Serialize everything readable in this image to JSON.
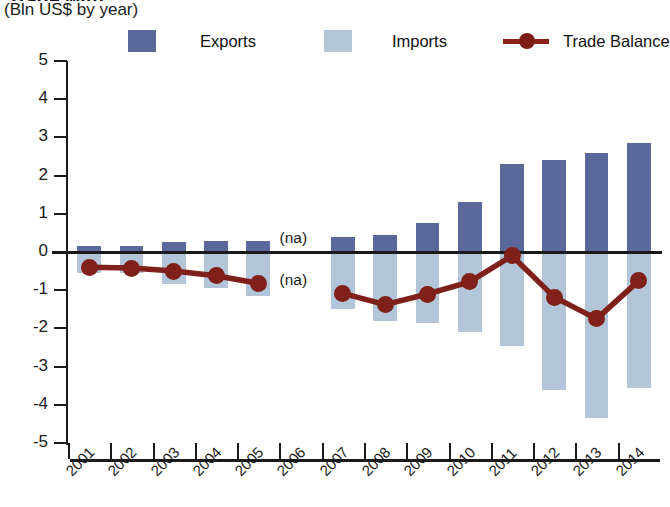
{
  "header": {
    "title_clipped": "Trade with ...",
    "subtitle": "(Bln US$ by year)"
  },
  "legend": {
    "position": "top",
    "items": [
      {
        "label": "Exports",
        "marker": "square-swatch",
        "color": "#5a689c"
      },
      {
        "label": "Imports",
        "marker": "square-swatch",
        "color": "#b2c5d9"
      },
      {
        "label": "Trade Balance",
        "marker": "line-with-circle",
        "color": "#80201a"
      }
    ]
  },
  "chart_data": {
    "type": "bar",
    "title": "",
    "subtitle": "(Bln US$ by year)",
    "xlabel": "",
    "ylabel": "",
    "ylim": [
      -5,
      5
    ],
    "yticks": [
      5,
      4,
      3,
      2,
      1,
      0,
      -1,
      -2,
      -3,
      -4,
      -5
    ],
    "ytick_labels": [
      "5",
      "4",
      "3",
      "2",
      "1",
      "0",
      "-1",
      "-2",
      "-3",
      "-4",
      "-5"
    ],
    "grid": false,
    "zero_line": true,
    "categories": [
      "2001",
      "2002",
      "2003",
      "2004",
      "2005",
      "2006",
      "2007",
      "2008",
      "2009",
      "2010",
      "2011",
      "2012",
      "2013",
      "2014"
    ],
    "series": [
      {
        "name": "Exports",
        "type": "bar",
        "color": "#5a689c",
        "values": [
          0.15,
          0.15,
          0.25,
          0.3,
          0.3,
          null,
          0.4,
          0.45,
          0.75,
          1.3,
          2.3,
          2.4,
          2.6,
          2.85
        ]
      },
      {
        "name": "Imports",
        "type": "bar",
        "color": "#b2c5d9",
        "values": [
          -0.55,
          -0.55,
          -0.85,
          -0.95,
          -1.15,
          null,
          -1.5,
          -1.8,
          -1.85,
          -2.1,
          -2.45,
          -3.6,
          -4.35,
          -3.55
        ]
      },
      {
        "name": "Trade Balance",
        "type": "line",
        "color": "#80201a",
        "values": [
          -0.4,
          -0.42,
          -0.5,
          -0.62,
          -0.82,
          null,
          -1.08,
          -1.38,
          -1.1,
          -0.78,
          -0.1,
          -1.18,
          -1.75,
          -0.75
        ]
      }
    ],
    "annotations": [
      {
        "text": "(na)",
        "category": "2006",
        "value": 0.35
      },
      {
        "text": "(na)",
        "category": "2006",
        "value": -0.75
      }
    ]
  },
  "axes": {
    "x_label_rotation": -45,
    "y_axis_side": "left"
  }
}
